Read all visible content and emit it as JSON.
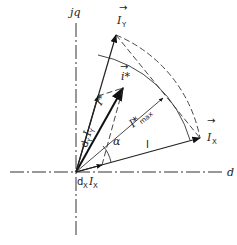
{
  "diagram": {
    "axes": {
      "horizontal_label": "d",
      "vertical_label": "jq"
    },
    "vectors": {
      "I_y": {
        "label": "I",
        "sub": "Y",
        "arrow": "→"
      },
      "I_x": {
        "label": "I",
        "sub": "X",
        "arrow": "→"
      },
      "i_star": {
        "label": "i*",
        "arrow": "→"
      },
      "I_star_max": {
        "label": "I*",
        "sub": "max"
      },
      "I_star": {
        "label": "I*"
      }
    },
    "component_labels": {
      "dy_Iy": {
        "prefix": "d",
        "prefix_sub": "Y",
        "vec": "I",
        "vec_sub": "Y"
      },
      "dx_Ix": {
        "prefix": "d",
        "prefix_sub": "X",
        "vec": "I",
        "vec_sub": "X"
      }
    },
    "angle_label": "α",
    "segment_label": "I",
    "colors": {
      "ink": "#222222",
      "background": "#ffffff"
    }
  }
}
